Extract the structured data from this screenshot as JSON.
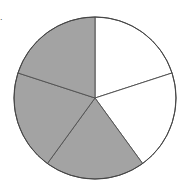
{
  "figure": {
    "corner_mark": "."
  },
  "chart_data": {
    "type": "pie",
    "title": "",
    "categories": [
      "Slice 1",
      "Slice 2",
      "Slice 3",
      "Slice 4",
      "Slice 5"
    ],
    "values": [
      20,
      20,
      20,
      20,
      20
    ],
    "shaded": [
      false,
      false,
      true,
      true,
      true
    ],
    "start_angle_deg": 0,
    "direction": "clockwise",
    "legend": null,
    "colors": {
      "shaded_fill": "#a3a3a3",
      "unshaded_fill": "#ffffff",
      "edge": "#555555",
      "outline": "#444444"
    },
    "geometry": {
      "cx": 95,
      "cy": 98,
      "r": 81
    }
  }
}
